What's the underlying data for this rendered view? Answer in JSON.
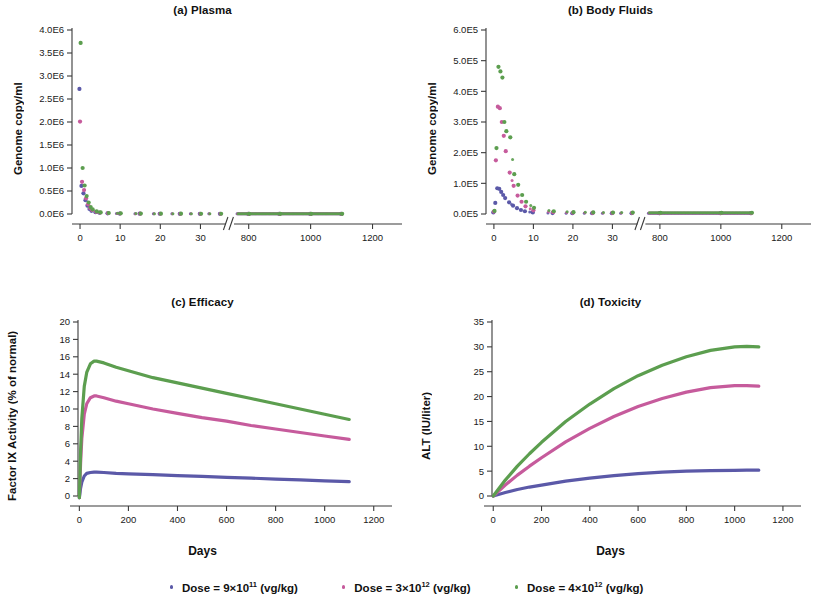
{
  "figure": {
    "panels": [
      {
        "id": "a",
        "title": "(a) Plasma",
        "ylabel": "Genome copy/ml",
        "xlabel": ""
      },
      {
        "id": "b",
        "title": "(b) Body Fluids",
        "ylabel": "Genome copy/ml",
        "xlabel": ""
      },
      {
        "id": "c",
        "title": "(c) Efficacy",
        "ylabel": "Factor IX Activity (% of normal)",
        "xlabel": "Days"
      },
      {
        "id": "d",
        "title": "(d) Toxicity",
        "ylabel": "ALT (IU/liter)",
        "xlabel": "Days"
      }
    ]
  },
  "legend": {
    "position": "bottom-center",
    "items": [
      {
        "label_prefix": "Dose = 9×10",
        "exp": "11",
        "label_suffix": " (vg/kg)",
        "full": "Dose = 9×10¹¹ (vg/kg)",
        "color": "#5b59a8",
        "marker": "dot"
      },
      {
        "label_prefix": "Dose = 3×10",
        "exp": "12",
        "label_suffix": " (vg/kg)",
        "full": "Dose = 3×10¹² (vg/kg)",
        "color": "#c65b9c",
        "marker": "dot"
      },
      {
        "label_prefix": "Dose = 4×10",
        "exp": "12",
        "label_suffix": " (vg/kg)",
        "full": "Dose = 4×10¹² (vg/kg)",
        "color": "#5c9e4f",
        "marker": "dot"
      }
    ]
  },
  "colors": {
    "dose_low": "#5b59a8",
    "dose_mid": "#c65b9c",
    "dose_high": "#5c9e4f",
    "axis": "#3a3a3a",
    "text": "#1a1a1a",
    "background": "#ffffff"
  },
  "chart_data": [
    {
      "type": "scatter",
      "panel": "a",
      "title": "(a) Plasma",
      "xlabel": "",
      "ylabel": "Genome copy/ml",
      "grid": false,
      "legend": "bottom",
      "broken_x_axis": true,
      "x_break_note": "axis break between 35 and 760 days drawn as //",
      "xticks_segment1": [
        0,
        10,
        20,
        30
      ],
      "xticks_segment2": [
        800,
        1000,
        1200
      ],
      "xlim_segment1": [
        -2,
        35
      ],
      "xlim_segment2": [
        760,
        1250
      ],
      "yticks": [
        "0.0E6",
        "0.5E6",
        "1.0E6",
        "1.5E6",
        "2.0E6",
        "2.5E6",
        "3.0E6",
        "3.5E6",
        "4.0E6"
      ],
      "ytick_values": [
        0,
        500000,
        1000000,
        1500000,
        2000000,
        2500000,
        3000000,
        3500000,
        4000000
      ],
      "ylim": [
        0,
        4000000
      ],
      "units": "genome copies per ml",
      "series": [
        {
          "name": "Dose = 9×10¹¹ (vg/kg)",
          "color": "#5b59a8",
          "x": [
            0,
            0.5,
            1,
            1.5,
            2,
            2.5,
            3,
            4,
            5,
            7,
            10,
            15,
            20,
            25,
            30,
            35,
            800,
            900,
            1000,
            1100
          ],
          "y": [
            2720000,
            610000,
            450000,
            300000,
            180000,
            110000,
            70000,
            40000,
            25000,
            15000,
            9000,
            6000,
            5000,
            4000,
            4000,
            3500,
            3000,
            3000,
            3000,
            3000
          ]
        },
        {
          "name": "Dose = 3×10¹² (vg/kg)",
          "color": "#c65b9c",
          "x": [
            0,
            0.5,
            1,
            1.5,
            2,
            2.5,
            3,
            4,
            5,
            7,
            10,
            15,
            20,
            25,
            30,
            35,
            800,
            900,
            1000,
            1100
          ],
          "y": [
            2010000,
            700000,
            520000,
            340000,
            210000,
            130000,
            85000,
            48000,
            30000,
            18000,
            11000,
            7000,
            5500,
            4500,
            4000,
            4000,
            3500,
            3500,
            3500,
            3500
          ]
        },
        {
          "name": "Dose = 4×10¹² (vg/kg)",
          "color": "#5c9e4f",
          "x": [
            0,
            0.5,
            1,
            1.5,
            2,
            2.5,
            3,
            4,
            5,
            7,
            10,
            15,
            20,
            25,
            30,
            35,
            800,
            900,
            1000,
            1100
          ],
          "y": [
            3720000,
            1000000,
            620000,
            390000,
            250000,
            150000,
            100000,
            55000,
            35000,
            22000,
            14000,
            9000,
            7000,
            6000,
            5000,
            5000,
            4500,
            4500,
            4500,
            4500
          ]
        }
      ]
    },
    {
      "type": "scatter",
      "panel": "b",
      "title": "(b) Body Fluids",
      "xlabel": "",
      "ylabel": "Genome copy/ml",
      "grid": false,
      "legend": "bottom",
      "broken_x_axis": true,
      "x_break_note": "axis break between 35 and 760 days drawn as //",
      "xticks_segment1": [
        0,
        10,
        20,
        30
      ],
      "xticks_segment2": [
        800,
        1000,
        1200
      ],
      "xlim_segment1": [
        -2,
        35
      ],
      "xlim_segment2": [
        760,
        1250
      ],
      "yticks": [
        "0.0E5",
        "1.0E5",
        "2.0E5",
        "3.0E5",
        "4.0E5",
        "5.0E5",
        "6.0E5"
      ],
      "ytick_values": [
        0,
        100000,
        200000,
        300000,
        400000,
        500000,
        600000
      ],
      "ylim": [
        0,
        600000
      ],
      "units": "genome copies per ml",
      "series": [
        {
          "name": "Dose = 9×10¹¹ (vg/kg)",
          "color": "#5b59a8",
          "x": [
            0,
            0.5,
            1,
            1.5,
            2,
            2.5,
            3,
            4,
            5,
            6,
            7,
            8,
            10,
            15,
            20,
            25,
            30,
            35,
            800,
            1000,
            1100
          ],
          "y": [
            5000,
            36000,
            84000,
            82000,
            72000,
            62000,
            52000,
            38000,
            27000,
            19000,
            13000,
            9000,
            5000,
            3000,
            2500,
            2500,
            2500,
            2500,
            2500,
            2500,
            2500
          ]
        },
        {
          "name": "Dose = 3×10¹² (vg/kg)",
          "color": "#c65b9c",
          "x": [
            0,
            0.5,
            1,
            1.5,
            2,
            2.5,
            3,
            4,
            5,
            6,
            7,
            8,
            10,
            15,
            20,
            25,
            30,
            35,
            800,
            1000,
            1100
          ],
          "y": [
            8000,
            175000,
            350000,
            345000,
            300000,
            255000,
            205000,
            135000,
            92000,
            60000,
            40000,
            25000,
            12000,
            6000,
            4000,
            3500,
            3500,
            3500,
            3000,
            3000,
            3000
          ]
        },
        {
          "name": "Dose = 4×10¹² (vg/kg)",
          "color": "#5c9e4f",
          "x": [
            0,
            0.5,
            1,
            1.5,
            2,
            2.5,
            3,
            4,
            5,
            6,
            7,
            8,
            10,
            15,
            20,
            25,
            30,
            35,
            800,
            1000,
            1100
          ],
          "y": [
            10000,
            215000,
            480000,
            465000,
            445000,
            300000,
            270000,
            250000,
            130000,
            95000,
            62000,
            40000,
            20000,
            9000,
            6000,
            5000,
            4500,
            4500,
            4000,
            4000,
            4000
          ]
        }
      ]
    },
    {
      "type": "line",
      "panel": "c",
      "title": "(c) Efficacy",
      "xlabel": "Days",
      "ylabel": "Factor IX Activity (% of normal)",
      "grid": false,
      "legend": "bottom",
      "xticks": [
        0,
        200,
        400,
        600,
        800,
        1000,
        1200
      ],
      "xlim": [
        -30,
        1250
      ],
      "yticks": [
        0,
        2,
        4,
        6,
        8,
        10,
        12,
        14,
        16,
        18,
        20
      ],
      "ylim": [
        0,
        20
      ],
      "units": "% of normal Factor IX activity",
      "x": [
        0,
        5,
        10,
        20,
        30,
        45,
        60,
        70,
        100,
        150,
        200,
        300,
        400,
        500,
        600,
        700,
        800,
        900,
        1000,
        1100
      ],
      "series": [
        {
          "name": "Dose = 9×10¹¹ (vg/kg)",
          "color": "#5b59a8",
          "values": [
            -0.2,
            0.9,
            1.6,
            2.3,
            2.6,
            2.7,
            2.75,
            2.75,
            2.7,
            2.6,
            2.55,
            2.45,
            2.35,
            2.25,
            2.15,
            2.05,
            1.95,
            1.85,
            1.75,
            1.65
          ]
        },
        {
          "name": "Dose = 3×10¹² (vg/kg)",
          "color": "#c65b9c",
          "values": [
            -0.2,
            3.8,
            6.6,
            9.4,
            10.6,
            11.3,
            11.5,
            11.5,
            11.3,
            10.9,
            10.6,
            10.0,
            9.5,
            9.0,
            8.6,
            8.1,
            7.7,
            7.3,
            6.9,
            6.5
          ]
        },
        {
          "name": "Dose = 4×10¹² (vg/kg)",
          "color": "#5c9e4f",
          "values": [
            -0.2,
            5.1,
            8.9,
            12.6,
            14.2,
            15.2,
            15.5,
            15.5,
            15.3,
            14.8,
            14.4,
            13.6,
            13.0,
            12.4,
            11.8,
            11.2,
            10.6,
            10.0,
            9.4,
            8.8
          ]
        }
      ]
    },
    {
      "type": "line",
      "panel": "d",
      "title": "(d) Toxicity",
      "xlabel": "Days",
      "ylabel": "ALT (IU/liter)",
      "grid": false,
      "legend": "bottom",
      "xticks": [
        0,
        200,
        400,
        600,
        800,
        1000,
        1200
      ],
      "xlim": [
        -30,
        1250
      ],
      "yticks": [
        0,
        5,
        10,
        15,
        20,
        25,
        30,
        35
      ],
      "ylim": [
        0,
        35
      ],
      "units": "IU/liter ALT",
      "x": [
        0,
        25,
        50,
        100,
        150,
        200,
        300,
        400,
        500,
        600,
        700,
        800,
        900,
        1000,
        1050,
        1100
      ],
      "series": [
        {
          "name": "Dose = 9×10¹¹ (vg/kg)",
          "color": "#5b59a8",
          "values": [
            0.0,
            0.35,
            0.7,
            1.3,
            1.8,
            2.2,
            3.0,
            3.6,
            4.1,
            4.5,
            4.8,
            5.0,
            5.1,
            5.15,
            5.2,
            5.2
          ]
        },
        {
          "name": "Dose = 3×10¹² (vg/kg)",
          "color": "#c65b9c",
          "values": [
            0.0,
            1.1,
            2.2,
            4.2,
            6.0,
            7.7,
            10.9,
            13.6,
            16.0,
            18.0,
            19.6,
            20.9,
            21.8,
            22.2,
            22.2,
            22.1
          ]
        },
        {
          "name": "Dose = 4×10¹² (vg/kg)",
          "color": "#5c9e4f",
          "values": [
            0.0,
            1.6,
            3.2,
            6.0,
            8.5,
            10.8,
            15.0,
            18.5,
            21.6,
            24.2,
            26.3,
            28.0,
            29.3,
            30.0,
            30.1,
            30.0
          ]
        }
      ]
    }
  ]
}
